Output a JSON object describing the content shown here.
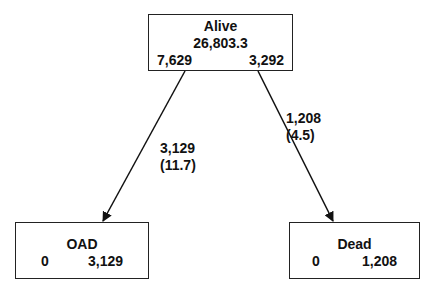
{
  "diagram": {
    "nodes": [
      {
        "id": "alive",
        "title": "Alive",
        "value": "26,803.3",
        "left_value": "7,629",
        "right_value": "3,292"
      },
      {
        "id": "oad",
        "title": "OAD",
        "left_value": "0",
        "right_value": "3,129"
      },
      {
        "id": "dead",
        "title": "Dead",
        "left_value": "0",
        "right_value": "1,208"
      }
    ],
    "edges": [
      {
        "from": "alive",
        "to": "oad",
        "count": "3,129",
        "rate": "(11.7)"
      },
      {
        "from": "alive",
        "to": "dead",
        "count": "1,208",
        "rate": "(4.5)"
      }
    ],
    "colors": {
      "line": "#111111",
      "background": "#ffffff"
    }
  }
}
